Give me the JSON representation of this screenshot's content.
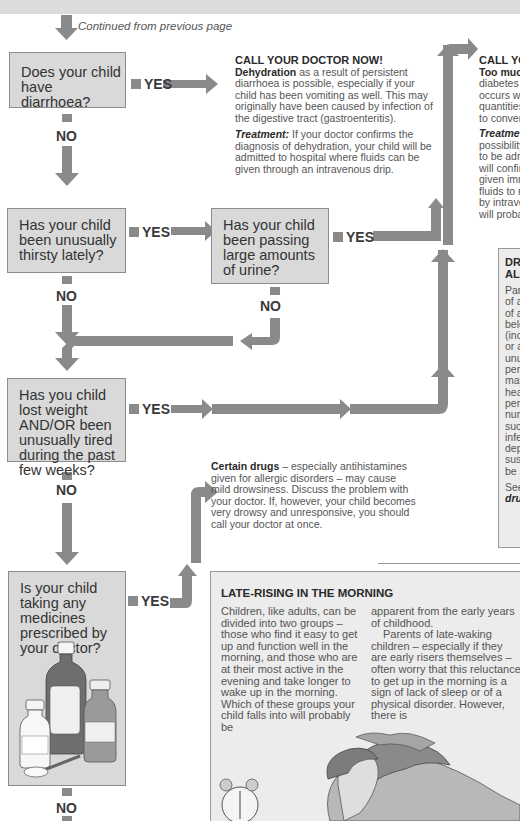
{
  "page": {
    "continued_note": "Continued from previous page"
  },
  "flow": {
    "q1": {
      "text": "Does your child have diarrhoea?",
      "yes": "YES",
      "no": "NO"
    },
    "q2": {
      "text": "Has your child been unusually thirsty lately?",
      "yes": "YES",
      "no": "NO"
    },
    "q2b": {
      "text": "Has your child been passing large amounts of urine?",
      "yes": "YES",
      "no": "NO"
    },
    "q3": {
      "text": "Has you child lost weight AND/OR been unusually tired during the past few weeks?",
      "yes": "YES",
      "no": "NO"
    },
    "q4": {
      "text": "Is your child taking any medicines prescribed by your doctor?",
      "yes": "YES",
      "no": "NO"
    }
  },
  "outcomes": {
    "dehydration": {
      "heading": "CALL YOUR DOCTOR NOW!",
      "bold_term": "Dehydration",
      "body": " as a result of persistent diarrhoea is possible, especially if your child has been vomiting as well. This may originally have been caused by infection of the digestive tract (gastroenteritis).",
      "treatment_label": "Treatment:",
      "treatment_body": " If your doctor confirms the diagnosis of dehydration, your child will be admitted to hospital where fluids can be given through an intravenous drip."
    },
    "diabetes": {
      "heading": "CALL YO",
      "bold_term": "Too muc",
      "lines": [
        "diabetes",
        "occurs w",
        "quantities",
        "to conver"
      ],
      "treatment_label": "Treatme",
      "treatment_lines": [
        "possibility",
        "to be adm",
        "will confir",
        "given imm",
        "fluids to r",
        "by intrave",
        "will proba"
      ]
    },
    "drugs": {
      "bold_term": "Certain drugs",
      "body": " – especially antihistamines given for allergic disorders – may cause mild drowsiness. Discuss the problem with your doctor. If, however, your child becomes very drowsy and unresponsive, you should call your doctor at once."
    }
  },
  "side_panel": {
    "heading_lines": [
      "DROW",
      "ALCOH"
    ],
    "lines": [
      "Parents",
      "of age s",
      "of abus",
      "belong",
      "(includi",
      "or alco",
      "unusua",
      "period c",
      "may inc",
      "headac",
      "perform",
      "numbe",
      "such sy",
      "infectio",
      "depres",
      "suspec",
      "be brou"
    ],
    "see_also": "See als",
    "see_also_link": "drug ab"
  },
  "late_rising": {
    "title": "LATE-RISING IN THE  MORNING",
    "col1": "Children, like adults, can be divided into two groups – those who find it easy to get up and function well in the morning, and those who are at their most active in the evening and take longer to wake up in the morning. Which of these groups your child falls into will probably be",
    "col2a": "apparent from the early years of childhood.",
    "col2b": "Parents of late-waking children – especially if they are early risers themselves – often worry that this reluctance to get up in the morning is a sign of lack of sleep or of a physical disorder. However, there is"
  },
  "colors": {
    "arrow": "#8a8a8a",
    "box_fill": "#d9d9d9",
    "panel_fill": "#ececec"
  }
}
